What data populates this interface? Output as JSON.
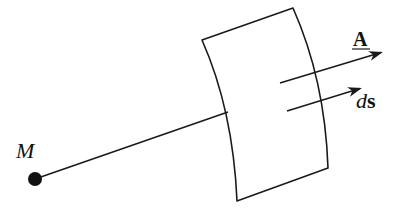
{
  "figure": {
    "type": "vector-field-surface-diagram",
    "colors": {
      "stroke": "#1a1a1a",
      "background": "#ffffff"
    },
    "point": {
      "label": "M",
      "x": 35,
      "y": 179
    },
    "labels": {
      "point": "M",
      "vector_field": "A",
      "area_element_d": "d",
      "area_element_s": "s"
    },
    "surface": {
      "corners": {
        "top_left": [
          202,
          40
        ],
        "top_right": [
          293,
          8
        ],
        "bottom_right": [
          328,
          168
        ],
        "bottom_left": [
          237,
          201
        ]
      }
    },
    "line_to_surface": {
      "from": [
        35,
        179
      ],
      "to": [
        228,
        112
      ]
    },
    "arrows": [
      {
        "name": "A",
        "from": [
          280,
          83
        ],
        "to": [
          383,
          52
        ]
      },
      {
        "name": "ds",
        "from": [
          287,
          111
        ],
        "to": [
          362,
          88
        ]
      }
    ]
  }
}
